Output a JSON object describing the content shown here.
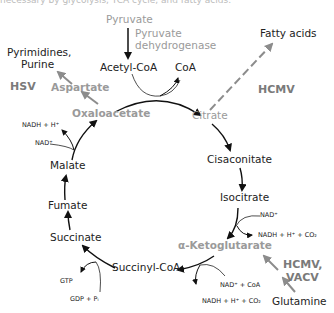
{
  "cutoff_caption": "necessary by glycolysis, TCA cycle, and fatty acids.",
  "input": {
    "label": "Pyruvate",
    "enzyme_line1": "Pyruvate",
    "enzyme_line2": "dehydrogenase"
  },
  "cycle": {
    "acetyl_coa": "Acetyl-CoA",
    "coa": "CoA",
    "citrate": "Citrate",
    "cisaconitate": "Cisaconitate",
    "isocitrate": "Isocitrate",
    "akg": "α-Ketoglutarate",
    "succinyl_coa": "Succinyl-CoA",
    "succinate": "Succinate",
    "fumarate": "Fumate",
    "malate": "Malate",
    "oxaloacetate": "Oxaloacetate"
  },
  "cofactors": {
    "nadh_top": "NADH + H⁺",
    "nad_top": "NAD⁺",
    "iso_nad": "NAD⁺",
    "iso_nadh": "NADH + H⁺ + CO₂",
    "akg_nad": "NAD⁺ + CoA",
    "akg_nadh": "NADH + H⁺ + CO₂",
    "gtp": "GTP",
    "gdp": "GDP + Pᵢ"
  },
  "branches": {
    "aspartate": "Aspartate",
    "pyrimidines_line1": "Pyrimidines,",
    "pyrimidines_line2": "Purine",
    "fatty_acids": "Fatty acids",
    "glutamine": "Glutamine"
  },
  "viruses": {
    "hsv": "HSV",
    "hcmv_fatty": "HCMV",
    "hcmv_vacv_line1": "HCMV,",
    "hcmv_vacv_line2": "VACV"
  },
  "colors": {
    "dark": "#222222",
    "gray": "#9a9a9a",
    "arrow_gray": "#8c8c8c"
  }
}
